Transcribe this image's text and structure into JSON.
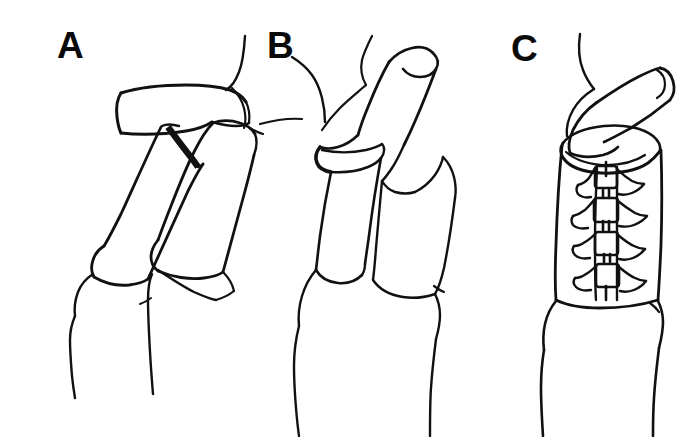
{
  "figure": {
    "background_color": "#ffffff",
    "ink_color": "#111111",
    "width": 700,
    "height": 437,
    "caption_fragment": ""
  },
  "panels": [
    {
      "id": "A",
      "label": "A",
      "name": "panel-a-flexed-deformity",
      "description": "Lateral view of finger showing flexed proximal interphalangeal joint with dorsal skin contour; the middle phalanx segment sits angled below a horizontal proximal segment, a dark wedge marking the joint gap.",
      "label_x": 57,
      "label_y": 27,
      "has_leader_line": false
    },
    {
      "id": "B",
      "label": "B",
      "name": "panel-b-extended-corrected",
      "description": "Same finger after correction; the digit is straightened so the distal segment points upward, leader line from the label points to the dorsal joint surface.",
      "label_x": 267,
      "label_y": 27,
      "has_leader_line": true
    },
    {
      "id": "C",
      "label": "C",
      "name": "panel-c-laced-brace",
      "description": "Finger held inside a cylindrical laced brace; the cuff opening shows the digit emerging at an angle and four lacing buckles run down the front seam.",
      "label_x": 511,
      "label_y": 30,
      "has_leader_line": false,
      "brace": {
        "buckle_count": 4,
        "buckle_positions_y": [
          176,
          207,
          241,
          272
        ],
        "buckle_center_x": 606,
        "lace_color": "#111111"
      }
    }
  ]
}
